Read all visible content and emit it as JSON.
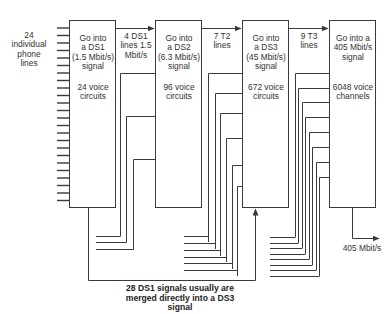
{
  "diagram": {
    "input_label": "24 individual phone lines",
    "input_label_lines": [
      "24",
      "individual",
      "phone",
      "lines"
    ],
    "boxes": [
      {
        "title_lines": [
          "Go into",
          "a DS1",
          "(1.5 Mbit/s)",
          "signal"
        ],
        "capacity_lines": [
          "24 voice",
          "circuits"
        ]
      },
      {
        "title_lines": [
          "Go into",
          "a DS2",
          "(6.3 Mbit/s)",
          "signal"
        ],
        "capacity_lines": [
          "96 voice",
          "circuits"
        ]
      },
      {
        "title_lines": [
          "Go into",
          "a DS3",
          "(45 Mbit/s)",
          "signal"
        ],
        "capacity_lines": [
          "672 voice",
          "circuits"
        ]
      },
      {
        "title_lines": [
          "Go into a",
          "405 Mbit/s",
          "signal"
        ],
        "capacity_lines": [
          "6048 voice",
          "channels"
        ]
      }
    ],
    "links": [
      {
        "label_lines": [
          "4 DS1",
          "lines 1.5",
          "Mbit/s"
        ]
      },
      {
        "label_lines": [
          "7 T2",
          "lines"
        ]
      },
      {
        "label_lines": [
          "9 T3",
          "lines"
        ]
      }
    ],
    "output_label": "405 Mbit/s",
    "note_lines": [
      "28 DS1 signals usually are",
      "merged directly into a DS3",
      "signal"
    ],
    "colors": {
      "line": "#3a3a3a",
      "text": "#333333",
      "background": "#ffffff"
    }
  }
}
